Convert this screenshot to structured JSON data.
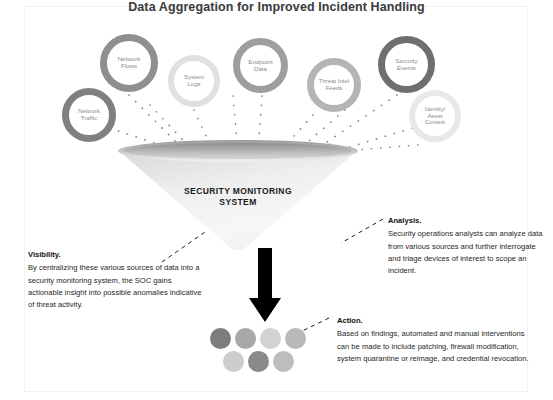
{
  "title": "Data Aggregation for Improved Incident Handling",
  "sources": [
    {
      "id": "network-flows",
      "label": "Network\nFlows",
      "lines": [
        "Network",
        "Flows"
      ],
      "x": 100,
      "y": 34,
      "size": 58,
      "ring": 7,
      "ring_color": "#8f8f8f",
      "font": 6.2
    },
    {
      "id": "network-traffic",
      "label": "Network\nTraffic",
      "lines": [
        "Network",
        "Traffic"
      ],
      "x": 62,
      "y": 88,
      "size": 54,
      "ring": 7,
      "ring_color": "#808080",
      "font": 6.0
    },
    {
      "id": "system-logs",
      "label": "System\nLogs",
      "lines": [
        "System",
        "Logs"
      ],
      "x": 168,
      "y": 55,
      "size": 52,
      "ring": 6.5,
      "ring_color": "#e0e0e0",
      "font": 6.0
    },
    {
      "id": "endpoint-data",
      "label": "Endpoint\nData",
      "lines": [
        "Endpoint",
        "Data"
      ],
      "x": 233,
      "y": 38,
      "size": 55,
      "ring": 7,
      "ring_color": "#9e9e9e",
      "font": 6.2
    },
    {
      "id": "threat-intel",
      "label": "Threat Intel\nFeeds",
      "lines": [
        "Threat Intel",
        "Feeds"
      ],
      "x": 307,
      "y": 58,
      "size": 54,
      "ring": 7,
      "ring_color": "#b5b5b5",
      "font": 6.0
    },
    {
      "id": "security-events",
      "label": "Security\nEvents",
      "lines": [
        "Security",
        "Events"
      ],
      "x": 378,
      "y": 36,
      "size": 57,
      "ring": 7.5,
      "ring_color": "#6f6f6f",
      "font": 6.2
    },
    {
      "id": "identity-asset",
      "label": "Identity/\nAsset\nContext",
      "lines": [
        "Identity/",
        "Asset",
        "Context"
      ],
      "x": 409,
      "y": 90,
      "size": 52,
      "ring": 6,
      "ring_color": "#e8e8e8",
      "font": 5.8
    }
  ],
  "funnel": {
    "label_line1": "SECURITY MONITORING",
    "label_line2": "SYSTEM"
  },
  "outcome_dots": [
    {
      "x": 0,
      "y": 0,
      "color": "#7d7d7d"
    },
    {
      "x": 25,
      "y": 0,
      "color": "#a8a8a8"
    },
    {
      "x": 50,
      "y": 0,
      "color": "#d2d2d2"
    },
    {
      "x": 75,
      "y": 0,
      "color": "#b9b9b9"
    },
    {
      "x": 13,
      "y": 23,
      "color": "#cdcdcd"
    },
    {
      "x": 38,
      "y": 23,
      "color": "#8a8a8a"
    },
    {
      "x": 63,
      "y": 23,
      "color": "#bdbdbd"
    }
  ],
  "callouts": {
    "visibility": {
      "head": "Visibility.",
      "body": "By centralizing these various sources of data into a security monitoring system, the SOC gains actionable insight into possible anomalies indicative of threat activity."
    },
    "analysis": {
      "head": "Analysis.",
      "body": "Security operations analysts can analyze data from various sources and further interrogate and triage devices of interest to scope an incident."
    },
    "action": {
      "head": "Action.",
      "body": "Based on findings, automated and manual interventions can be made to include patching, firewall modification, system quarantine or reimage, and credential revocation."
    }
  }
}
